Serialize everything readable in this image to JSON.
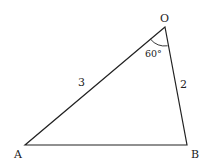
{
  "diagram": {
    "type": "triangle",
    "vertices": {
      "O": {
        "label": "O",
        "x": 165,
        "y": 27
      },
      "A": {
        "label": "A",
        "x": 25,
        "y": 145
      },
      "B": {
        "label": "B",
        "x": 187,
        "y": 145
      }
    },
    "sides": {
      "OA": {
        "label": "3"
      },
      "OB": {
        "label": "2"
      }
    },
    "angle": {
      "vertex": "O",
      "label": "60°"
    },
    "colors": {
      "stroke": "#222222",
      "background": "#ffffff"
    }
  }
}
